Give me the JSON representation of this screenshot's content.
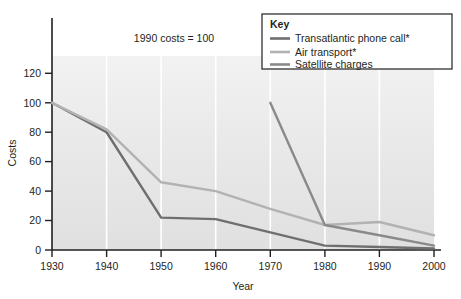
{
  "chart_data": {
    "type": "line",
    "title": "",
    "annotation": "1990 costs = 100",
    "xlabel": "Year",
    "ylabel": "Costs",
    "x": [
      1930,
      1940,
      1950,
      1960,
      1970,
      1980,
      1990,
      2000
    ],
    "xticklabels": [
      "1930",
      "1940",
      "1950",
      "1960",
      "1970",
      "1980",
      "1990",
      "2000"
    ],
    "yticklabels": [
      "0",
      "20",
      "40",
      "60",
      "80",
      "100",
      "120"
    ],
    "yticks": [
      0,
      20,
      40,
      60,
      80,
      100,
      120
    ],
    "xlim": [
      1930,
      2000
    ],
    "ylim": [
      0,
      132
    ],
    "grid": "vertical-white",
    "legend_position": "top-right",
    "legend_title": "Key",
    "series": [
      {
        "name": "Transatlantic phone call*",
        "color": "#6f6f6f",
        "x": [
          1930,
          1940,
          1950,
          1960,
          1970,
          1980,
          1990,
          2000
        ],
        "values": [
          100,
          80,
          22,
          21,
          12,
          3,
          2,
          1
        ]
      },
      {
        "name": "Air transport*",
        "color": "#b2b2b2",
        "x": [
          1930,
          1940,
          1950,
          1960,
          1970,
          1980,
          1990,
          2000
        ],
        "values": [
          100,
          82,
          46,
          40,
          28,
          17,
          19,
          10
        ]
      },
      {
        "name": "Satellite charges",
        "color": "#8a8a8a",
        "x": [
          1970,
          1980,
          1990,
          2000
        ],
        "values": [
          100,
          17,
          10,
          3
        ]
      }
    ]
  },
  "axes": {
    "y_title": "Costs",
    "x_title": "Year",
    "y_ticks": [
      "120",
      "100",
      "80",
      "60",
      "40",
      "20",
      "0"
    ],
    "x_ticks": [
      "1930",
      "1940",
      "1950",
      "1960",
      "1970",
      "1980",
      "1990",
      "2000"
    ]
  },
  "annotation": {
    "text": "1990 costs = 100"
  },
  "legend": {
    "title": "Key",
    "items": [
      {
        "label": "Transatlantic phone call*",
        "color": "#6f6f6f"
      },
      {
        "label": "Air transport*",
        "color": "#b2b2b2"
      },
      {
        "label": "Satellite charges",
        "color": "#8a8a8a"
      }
    ]
  },
  "colors": {
    "plot_background_top": "#efefef",
    "plot_background_bottom": "#e3e3e3",
    "gridline": "#ffffff",
    "axis": "#231f20",
    "page_background": "#ffffff"
  }
}
